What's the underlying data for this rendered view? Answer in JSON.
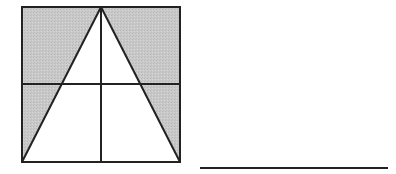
{
  "figure": {
    "colors": {
      "shade": "#c8c8c8",
      "stroke": "#222222",
      "background": "#ffffff"
    },
    "square": {
      "x": 22,
      "y": 7,
      "size": 158
    },
    "triangle": {
      "apex": [
        101,
        7
      ],
      "base_left": [
        22,
        162
      ],
      "base_right": [
        180,
        162
      ]
    },
    "midlines": {
      "vertical_x": 101,
      "horizontal_y": 84
    },
    "answer_line": {
      "x1": 200,
      "x2": 388,
      "y": 168
    }
  }
}
